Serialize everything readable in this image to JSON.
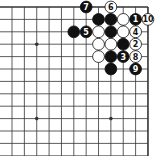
{
  "diagram": {
    "type": "go-board-fragment",
    "grid": {
      "cols": 12,
      "rows": 13,
      "origin_x": 12,
      "origin_y": 7,
      "spacing_x": 12.36,
      "spacing_y": 12.4,
      "top_edge": true,
      "right_edge": true
    },
    "star_points": [
      {
        "col": 2,
        "row": 3
      },
      {
        "col": 2,
        "row": 9
      },
      {
        "col": 8,
        "row": 9
      }
    ],
    "stones": [
      {
        "col": 6,
        "row": 0,
        "color": "black",
        "label": "7"
      },
      {
        "col": 8,
        "row": 0,
        "color": "white",
        "label": "6"
      },
      {
        "col": 7,
        "row": 1,
        "color": "black",
        "label": ""
      },
      {
        "col": 8,
        "row": 1,
        "color": "black",
        "label": ""
      },
      {
        "col": 9,
        "row": 1,
        "color": "white",
        "label": ""
      },
      {
        "col": 10,
        "row": 1,
        "color": "black",
        "label": "1"
      },
      {
        "col": 11,
        "row": 1,
        "color": "white",
        "label": "10"
      },
      {
        "col": 5,
        "row": 2,
        "color": "black",
        "label": ""
      },
      {
        "col": 6,
        "row": 2,
        "color": "black",
        "label": "5"
      },
      {
        "col": 7,
        "row": 2,
        "color": "white",
        "label": ""
      },
      {
        "col": 8,
        "row": 2,
        "color": "black",
        "label": ""
      },
      {
        "col": 9,
        "row": 2,
        "color": "white",
        "label": ""
      },
      {
        "col": 10,
        "row": 2,
        "color": "white",
        "label": "4"
      },
      {
        "col": 7,
        "row": 3,
        "color": "white",
        "label": ""
      },
      {
        "col": 8,
        "row": 3,
        "color": "white",
        "label": ""
      },
      {
        "col": 9,
        "row": 3,
        "color": "black",
        "label": ""
      },
      {
        "col": 10,
        "row": 3,
        "color": "white",
        "label": "2"
      },
      {
        "col": 7,
        "row": 4,
        "color": "white",
        "label": ""
      },
      {
        "col": 8,
        "row": 4,
        "color": "black",
        "label": ""
      },
      {
        "col": 9,
        "row": 4,
        "color": "black",
        "label": "3"
      },
      {
        "col": 10,
        "row": 4,
        "color": "white",
        "label": "8"
      },
      {
        "col": 8,
        "row": 5,
        "color": "black",
        "label": ""
      },
      {
        "col": 10,
        "row": 5,
        "color": "black",
        "label": "9"
      }
    ],
    "colors": {
      "background": "#ffffff",
      "line": "#333333",
      "black_stone": "#111111",
      "white_stone": "#ffffff"
    }
  }
}
